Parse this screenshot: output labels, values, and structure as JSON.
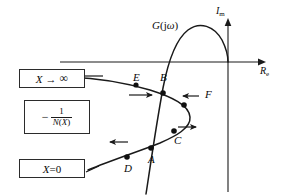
{
  "figure": {
    "type": "describing-function-nyquist-diagram",
    "background_color": "#ffffff",
    "stroke_color": "#1a1a1a"
  },
  "axes": {
    "imaginary_label": "I",
    "imaginary_subscript": "m",
    "real_label": "R",
    "real_subscript": "e"
  },
  "curves": {
    "g_label_prefix": "G",
    "g_label_open": "(",
    "g_label_j": "j",
    "g_label_omega": "ω",
    "g_label_close": ")",
    "negative_inverse_n_minus": "−",
    "negative_inverse_n_numerator": "1",
    "negative_inverse_n_denominator_fn": "N",
    "negative_inverse_n_denominator_open": "(",
    "negative_inverse_n_denominator_var": "X",
    "negative_inverse_n_denominator_close": ")"
  },
  "boxes": {
    "x_to_infinity": {
      "variable": "X",
      "arrow": "→",
      "limit": "∞"
    },
    "x_zero": {
      "variable": "X",
      "operator": "=",
      "value": "0"
    }
  },
  "points": [
    {
      "id": "A",
      "label": "A",
      "x": 150,
      "y": 157
    },
    {
      "id": "B",
      "label": "B",
      "x": 163,
      "y": 88
    },
    {
      "id": "C",
      "label": "C",
      "x": 176,
      "y": 136
    },
    {
      "id": "D",
      "label": "D",
      "x": 128,
      "y": 152
    },
    {
      "id": "E",
      "label": "E",
      "x": 136,
      "y": 85
    },
    {
      "id": "F",
      "label": "F",
      "x": 190,
      "y": 97
    }
  ],
  "arrows": [
    {
      "id": "arrow-x-inf-left",
      "direction": "left"
    },
    {
      "id": "arrow-below-e-right",
      "direction": "right"
    },
    {
      "id": "arrow-f-left",
      "direction": "left"
    },
    {
      "id": "arrow-above-c-right",
      "direction": "right"
    },
    {
      "id": "arrow-left-of-d-left",
      "direction": "left"
    }
  ]
}
